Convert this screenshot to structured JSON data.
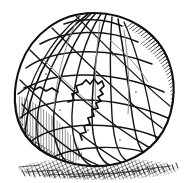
{
  "artwork": {
    "title": "Wireframe Globe Engraving",
    "subject_name": "globe-sphere",
    "style": "pen-and-ink crosshatch engraving",
    "alt_text": "Hand-drawn wireframe globe with latitude and longitude grid lines, crosshatched shading on the right and lower-left limb, a jagged continent outline near the center, and a hatched ground shadow beneath.",
    "canvas": {
      "width": 187,
      "height": 183,
      "background_color": "#ffffff"
    },
    "colors": {
      "ink": "#111111",
      "ink_soft": "#3a3a3a",
      "ink_faint": "#8a8a8a",
      "paper": "#ffffff",
      "shadow": "#1a1a1a"
    },
    "sphere": {
      "label": "globe-body",
      "center_x": 93,
      "center_y": 89,
      "radius_x": 79,
      "radius_y": 76,
      "top_y": 13,
      "bottom_y": 165,
      "left_x": 15,
      "right_x": 172,
      "outline_stroke_width": 2.1
    },
    "grid": {
      "label": "lat-long-grid",
      "meridian_count": 9,
      "parallel_count": 7,
      "stroke_width": 1.5,
      "tilt_degrees": -18
    },
    "shading": {
      "right_limb": {
        "label": "right-limb-hatching",
        "direction": "diagonal-down-right",
        "line_count": 46,
        "density": "dense"
      },
      "lower_left": {
        "label": "lower-left-hatching",
        "direction": "vertical",
        "line_count": 34,
        "density": "medium"
      },
      "bottom_edge": {
        "label": "bottom-crosshatch",
        "direction": "crosshatch",
        "line_count": 40,
        "density": "dense"
      }
    },
    "continent": {
      "label": "continent-outline",
      "description": "jagged coastline glyph near the center of the globe",
      "center_x": 92,
      "center_y": 97
    },
    "ground_shadow": {
      "label": "ground-shadow",
      "left_x": 18,
      "right_x": 179,
      "top_y": 158,
      "bottom_y": 179,
      "hatch_count": 88,
      "direction": "short-vertical-strokes"
    }
  }
}
